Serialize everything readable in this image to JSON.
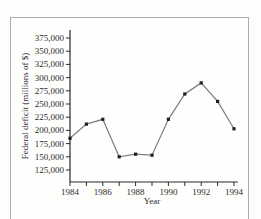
{
  "frame": {
    "background_color": "#fdfdfb",
    "card_border_color": "#ababab"
  },
  "chart_data": {
    "type": "line",
    "title": "",
    "xlabel": "Year",
    "ylabel": "Federal deficit (millions of $)",
    "x": [
      1984,
      1985,
      1986,
      1987,
      1988,
      1989,
      1990,
      1991,
      1992,
      1993,
      1994
    ],
    "values": [
      185000,
      212000,
      221000,
      150000,
      155000,
      153000,
      221000,
      269000,
      290000,
      255000,
      203000
    ],
    "xlim": [
      1984,
      1994
    ],
    "ylim": [
      125000,
      375000
    ],
    "xtick_labeled_years": [
      1984,
      1986,
      1988,
      1990,
      1992,
      1994
    ],
    "xtick_minor_years": [
      1985,
      1987,
      1989,
      1991,
      1993
    ],
    "ytick_values": [
      125000,
      150000,
      175000,
      200000,
      225000,
      250000,
      275000,
      300000,
      325000,
      350000,
      375000
    ],
    "ytick_labels": [
      "125,000",
      "150,000",
      "175,000",
      "200,000",
      "225,000",
      "250,000",
      "275,000",
      "300,000",
      "325,000",
      "350,000",
      "375,000"
    ],
    "grid": false,
    "legend": null,
    "line_color": "#7d7d7d",
    "marker": "square",
    "marker_color": "#1f1f1f",
    "axis_color": "#2b2b2b",
    "text_color": "#2b2b2b"
  }
}
